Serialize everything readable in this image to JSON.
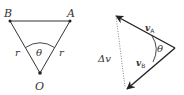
{
  "left_diagram": {
    "points": {
      "B": {
        "label": "B"
      },
      "A": {
        "label": "A"
      },
      "O": {
        "label": "O"
      }
    },
    "side_labels": {
      "left": "r",
      "right": "r"
    },
    "angle_label": "θ"
  },
  "right_diagram": {
    "vectors": {
      "vA": {
        "label": "v",
        "subscript": "A"
      },
      "vB": {
        "label": "v",
        "subscript": "B"
      }
    },
    "difference_label": "Δv",
    "angle_label": "θ"
  },
  "colors": {
    "stroke": "#333333",
    "dotted": "#777777"
  }
}
